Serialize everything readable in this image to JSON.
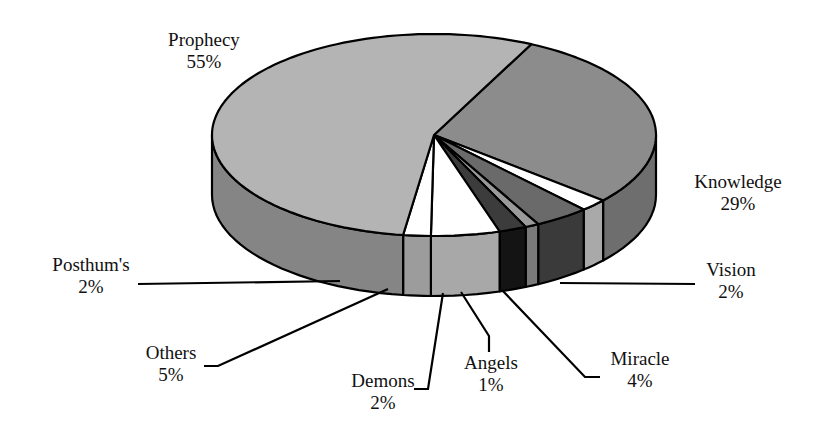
{
  "chart_data": {
    "type": "pie",
    "style": "3d-exploded-wedge",
    "title": "",
    "start_category": "Knowledge",
    "direction": "clockwise",
    "slices": [
      {
        "label": "Knowledge",
        "pct_label": "29%",
        "value": 29,
        "color": "#8c8c8c",
        "side_color": "#6e6e6e"
      },
      {
        "label": "Vision",
        "pct_label": "2%",
        "value": 2,
        "color": "#ffffff",
        "side_color": "#a9a9a9"
      },
      {
        "label": "Miracle",
        "pct_label": "4%",
        "value": 4,
        "color": "#6a6a6a",
        "side_color": "#3a3a3a"
      },
      {
        "label": "Angels",
        "pct_label": "1%",
        "value": 1,
        "color": "#9a9a9a",
        "side_color": "#7a7a7a"
      },
      {
        "label": "Demons",
        "pct_label": "2%",
        "value": 2,
        "color": "#3c3c3c",
        "side_color": "#141414"
      },
      {
        "label": "Others",
        "pct_label": "5%",
        "value": 5,
        "color": "#ffffff",
        "side_color": "#a8a8a8"
      },
      {
        "label": "Posthum's",
        "pct_label": "2%",
        "value": 2,
        "color": "#ffffff",
        "side_color": "#9c9c9c"
      },
      {
        "label": "Prophecy",
        "pct_label": "55%",
        "value": 55,
        "color": "#b4b4b4",
        "side_color": "#858585"
      }
    ]
  }
}
